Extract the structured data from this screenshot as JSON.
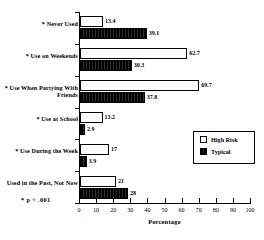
{
  "chart_data": {
    "type": "bar",
    "orientation": "horizontal",
    "title": "",
    "xlabel": "Percentage",
    "ylabel": "",
    "xlim": [
      0,
      100
    ],
    "xticks": [
      0,
      10,
      20,
      30,
      40,
      50,
      60,
      70,
      80,
      90,
      100
    ],
    "grid": false,
    "legend_position": "center-right",
    "categories": [
      "* Never Used",
      "* Use on Weekends",
      "* Use When Partying With Friends",
      "* Use at School",
      "* Use During the Week",
      "Used in the Past, Not Now"
    ],
    "series": [
      {
        "name": "High Risk",
        "fill": "#ffffff",
        "values": [
          13.4,
          62.7,
          69.7,
          13.2,
          17,
          21
        ],
        "labels": [
          "13.4",
          "62.7",
          "69.7",
          "13.2",
          "17",
          "21"
        ]
      },
      {
        "name": "Typical",
        "fill": "#000000",
        "values": [
          39.1,
          30.3,
          37.8,
          2.9,
          3.9,
          28
        ],
        "labels": [
          "39.1",
          "30.3",
          "37.8",
          "2.9",
          "3.9",
          "28"
        ]
      }
    ],
    "annotations": [
      "* p < .001"
    ]
  },
  "axis": {
    "x_title": "Percentage",
    "tick_labels": [
      "0",
      "10",
      "20",
      "30",
      "40",
      "50",
      "60",
      "70",
      "80",
      "90",
      "100"
    ]
  },
  "legend": {
    "entries": [
      {
        "label": "High Risk",
        "swatch": "open-square-icon"
      },
      {
        "label": "Typical",
        "swatch": "filled-square-icon"
      }
    ]
  },
  "footnote": {
    "text": "* p < .001"
  }
}
